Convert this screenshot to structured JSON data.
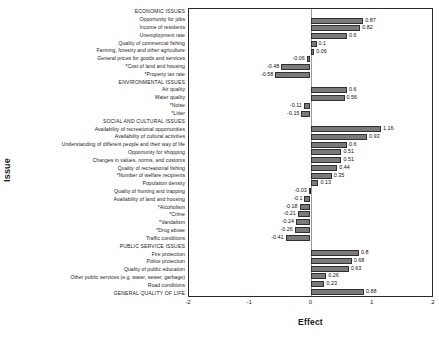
{
  "chart_data": {
    "type": "bar",
    "orientation": "horizontal",
    "title": "",
    "xlabel": "Effect",
    "ylabel": "Issue",
    "xlim": [
      -2,
      2
    ],
    "xticks": [
      -2,
      -1,
      0,
      1,
      2
    ],
    "xtick_labels": [
      "-2",
      "-1",
      "0",
      "1",
      "2"
    ],
    "grid": false,
    "legend": "none",
    "zero_reference_line": true,
    "bar_color": "#7a7a7a",
    "bar_edge_color": "#303030",
    "categories": [
      "ECONOMIC ISSUES",
      "Opportunity for jobs",
      "Income of residents",
      "Unemployment rate",
      "Quality of commercial fishing",
      "Farming, forestry and other agriculture",
      "General prices for goods and services",
      "*Cost of land and housing",
      "*Property tax rate",
      "ENVIRONMENTAL ISSUES",
      "Air quality",
      "Water quality",
      "*Noise",
      "*Litter",
      "SOCIAL AND CULTURAL ISSUES",
      "Availability of recreational opportunities",
      "Availability of cultural activities",
      "Understanding of different people and their way of life",
      "Opportunity for shopping",
      "Changes in values, norms, and customs",
      "Quality of recreational fishing",
      "*Number of welfare recipients",
      "Population density",
      "Quality of hunting and trapping",
      "Availability of land and housing",
      "*Alcoholism",
      "*Crime",
      "*Vandalism",
      "*Drug abuse",
      "Traffic conditions",
      "PUBLIC SERVICE ISSUES",
      "Fire protection",
      "Police protection",
      "Quality of public education",
      "Other public services (e.g. water, sewer, garbage)",
      "Road conditions",
      "GENERAL QUALITY OF LIFE"
    ],
    "is_header": [
      true,
      false,
      false,
      false,
      false,
      false,
      false,
      false,
      false,
      true,
      false,
      false,
      false,
      false,
      true,
      false,
      false,
      false,
      false,
      false,
      false,
      false,
      false,
      false,
      false,
      false,
      false,
      false,
      false,
      false,
      true,
      false,
      false,
      false,
      false,
      false,
      true
    ],
    "values": [
      null,
      0.87,
      0.82,
      0.6,
      0.1,
      0.06,
      -0.06,
      -0.48,
      -0.58,
      null,
      0.6,
      0.56,
      -0.11,
      -0.15,
      null,
      1.16,
      0.93,
      0.6,
      0.51,
      0.51,
      0.44,
      0.35,
      0.13,
      -0.03,
      -0.1,
      -0.18,
      -0.21,
      -0.24,
      -0.26,
      -0.41,
      null,
      0.8,
      0.68,
      0.63,
      0.26,
      0.23,
      null
    ],
    "value_labels": [
      "",
      "0.87",
      "0.82",
      "0.6",
      "0.1",
      "0.06",
      "-0.06",
      "-0.48",
      "-0.58",
      "",
      "0.6",
      "0.56",
      "-0.11",
      "-0.15",
      "",
      "1.16",
      "0.93",
      "0.6",
      "0.51",
      "0.51",
      "0.44",
      "0.35",
      "0.13",
      "-0.03",
      "-0.1",
      "-0.18",
      "-0.21",
      "-0.24",
      "-0.26",
      "-0.41",
      "",
      "0.8",
      "0.68",
      "0.63",
      "0.26",
      "0.23",
      "0.88"
    ]
  }
}
